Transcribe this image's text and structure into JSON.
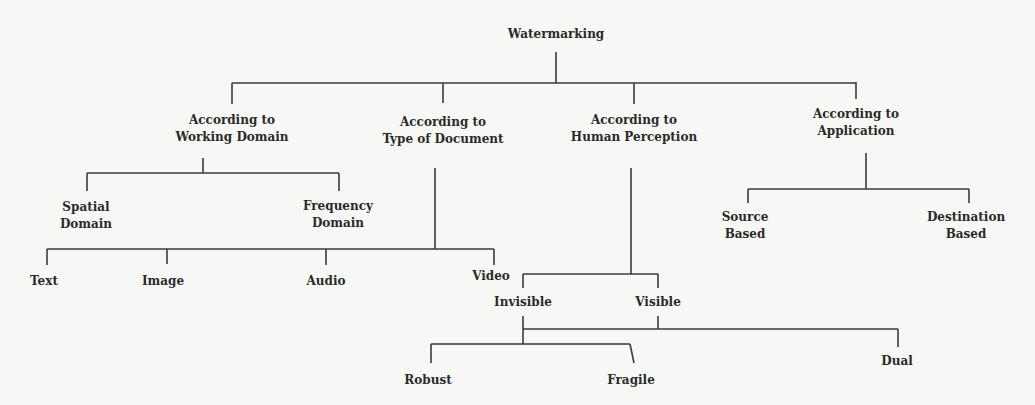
{
  "diagram": {
    "type": "tree",
    "root": {
      "label": [
        "Watermarking"
      ],
      "children": [
        {
          "label": [
            "According to",
            "Working Domain"
          ],
          "children": [
            {
              "label": [
                "Spatial",
                "Domain"
              ]
            },
            {
              "label": [
                "Frequency",
                "Domain"
              ]
            }
          ]
        },
        {
          "label": [
            "According to",
            "Type of Document"
          ],
          "children": [
            {
              "label": [
                "Text"
              ]
            },
            {
              "label": [
                "Image"
              ]
            },
            {
              "label": [
                "Audio"
              ]
            },
            {
              "label": [
                "Video"
              ]
            }
          ]
        },
        {
          "label": [
            "According to",
            "Human Perception"
          ],
          "children": [
            {
              "label": [
                "Invisible"
              ],
              "children": [
                {
                  "label": [
                    "Robust"
                  ]
                },
                {
                  "label": [
                    "Fragile"
                  ]
                }
              ]
            },
            {
              "label": [
                "Visible"
              ]
            },
            {
              "label": [
                "Dual"
              ]
            }
          ]
        },
        {
          "label": [
            "According to",
            "Application"
          ],
          "children": [
            {
              "label": [
                "Source",
                "Based"
              ]
            },
            {
              "label": [
                "Destination",
                "Based"
              ]
            }
          ]
        }
      ]
    }
  },
  "nodes": {
    "root": {
      "l1": "Watermarking"
    },
    "working_domain": {
      "l1": "According to",
      "l2": "Working Domain"
    },
    "type_of_document": {
      "l1": "According to",
      "l2": "Type of Document"
    },
    "human_perception": {
      "l1": "According to",
      "l2": "Human Perception"
    },
    "application": {
      "l1": "According to",
      "l2": "Application"
    },
    "spatial": {
      "l1": "Spatial",
      "l2": "Domain"
    },
    "frequency": {
      "l1": "Frequency",
      "l2": "Domain"
    },
    "text": {
      "l1": "Text"
    },
    "image": {
      "l1": "Image"
    },
    "audio": {
      "l1": "Audio"
    },
    "video": {
      "l1": "Video"
    },
    "invisible": {
      "l1": "Invisible"
    },
    "visible": {
      "l1": "Visible"
    },
    "robust": {
      "l1": "Robust"
    },
    "fragile": {
      "l1": "Fragile"
    },
    "dual": {
      "l1": "Dual"
    },
    "source": {
      "l1": "Source",
      "l2": "Based"
    },
    "destination": {
      "l1": "Destination",
      "l2": "Based"
    }
  },
  "colors": {
    "background": "#f7f7f5",
    "line": "#3a3a3a",
    "text": "#2a2a2a"
  }
}
